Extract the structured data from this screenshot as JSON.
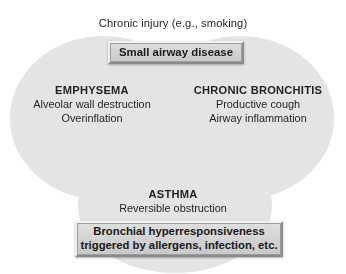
{
  "figure": {
    "title": "Chronic injury (e.g., smoking)",
    "width": 346,
    "height": 274,
    "background": "#ffffff"
  },
  "colors": {
    "ellipse_fill": "#e3e3e3",
    "ellipse_overlap": "#cfcfcf",
    "text": "#231f20",
    "box_face": "#d4d4d4",
    "box_highlight": "#f4f4f4",
    "box_shadow": "#8a8a8a"
  },
  "boxes": {
    "small_airway": {
      "label": "Small airway disease"
    },
    "bronchial": {
      "line1": "Bronchial hyperresponsiveness",
      "line2": "triggered by allergens, infection, etc."
    }
  },
  "groups": [
    {
      "id": "emphysema",
      "title": "EMPHYSEMA",
      "line1": "Alveolar wall destruction",
      "line2": "Overinflation"
    },
    {
      "id": "chronic-bronchitis",
      "title": "CHRONIC BRONCHITIS",
      "line1": "Productive cough",
      "line2": "Airway inflammation"
    },
    {
      "id": "asthma",
      "title": "ASTHMA",
      "line1": "Reversible obstruction",
      "line2": ""
    }
  ]
}
